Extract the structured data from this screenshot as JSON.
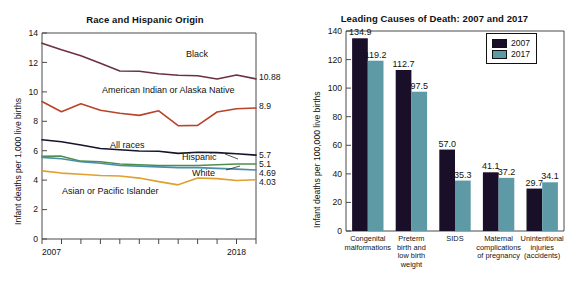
{
  "figure": {
    "width": 579,
    "height": 288,
    "background": "#ffffff"
  },
  "chart_data": [
    {
      "type": "line",
      "panel": "left",
      "title": "Race and Hispanic Origin",
      "xlabel": "",
      "ylabel": "Infant deaths per 1,000 live births",
      "xlim": [
        2007,
        2018
      ],
      "ylim": [
        0,
        14
      ],
      "yticks": [
        "0",
        "2",
        "4",
        "6",
        "8",
        "10",
        "12",
        "14"
      ],
      "xticks": [
        "2007",
        "2018"
      ],
      "x": [
        2007,
        2008,
        2009,
        2010,
        2011,
        2012,
        2013,
        2014,
        2015,
        2016,
        2017,
        2018
      ],
      "grid": false,
      "legend": "inline-labels",
      "series": [
        {
          "name": "Black",
          "color": "#6b3140",
          "label": "Black",
          "end_value": "10.88",
          "values": [
            13.31,
            12.86,
            12.45,
            11.95,
            11.42,
            11.4,
            11.23,
            11.13,
            11.09,
            10.87,
            11.15,
            10.88
          ]
        },
        {
          "name": "American Indian or Alaska Native",
          "color": "#b8432a",
          "label": "American Indian or Alaska Native",
          "end_value": "8.9",
          "values": [
            9.34,
            8.65,
            9.19,
            8.75,
            8.55,
            8.4,
            8.71,
            7.7,
            7.72,
            8.63,
            8.85,
            8.9
          ]
        },
        {
          "name": "All races",
          "color": "#14142c",
          "label": "All races",
          "end_value": "5.7",
          "values": [
            6.75,
            6.61,
            6.39,
            6.15,
            6.07,
            5.98,
            5.96,
            5.82,
            5.9,
            5.87,
            5.79,
            5.7
          ]
        },
        {
          "name": "Hispanic",
          "color": "#4f8f4b",
          "label": "Hispanic",
          "end_value": "5.1",
          "values": [
            5.62,
            5.63,
            5.29,
            5.25,
            5.1,
            5.05,
            5.0,
            5.0,
            5.0,
            5.05,
            5.1,
            5.1
          ]
        },
        {
          "name": "White",
          "color": "#4a8ea8",
          "label": "White",
          "end_value": "4.69",
          "values": [
            5.55,
            5.45,
            5.25,
            5.15,
            5.0,
            4.95,
            4.9,
            4.85,
            4.85,
            4.8,
            4.75,
            4.69
          ]
        },
        {
          "name": "Asian or Pacific Islander",
          "color": "#e0a030",
          "label": "Asian or Pacific Islander",
          "end_value": "4.03",
          "values": [
            4.63,
            4.48,
            4.4,
            4.32,
            4.28,
            4.14,
            3.9,
            3.68,
            4.15,
            4.1,
            3.98,
            4.03
          ]
        }
      ]
    },
    {
      "type": "bar",
      "panel": "right",
      "title": "Leading Causes of Death: 2007 and 2017",
      "xlabel": "",
      "ylabel": "Infant deaths per 100,000 live births",
      "ylim": [
        0,
        140
      ],
      "yticks": [
        "0",
        "20",
        "40",
        "60",
        "80",
        "100",
        "120",
        "140"
      ],
      "grid": false,
      "legend_position": "top-right",
      "categories": [
        "Congenital\nmalformations",
        "Preterm\nbirth and\nlow birth\nweight",
        "SIDS",
        "Maternal\ncomplications\nof pregnancy",
        "Unintentional\ninjuries\n(accidents)"
      ],
      "series": [
        {
          "name": "2007",
          "color": "#1a0f28",
          "values": [
            134.9,
            112.7,
            57.0,
            41.1,
            29.7
          ]
        },
        {
          "name": "2017",
          "color": "#5e9aa5",
          "values": [
            119.2,
            97.5,
            35.3,
            37.2,
            34.1
          ]
        }
      ],
      "value_labels": [
        [
          "134.9",
          "119.2"
        ],
        [
          "112.7",
          "97.5"
        ],
        [
          "57.0",
          "35.3"
        ],
        [
          "41.1",
          "37.2"
        ],
        [
          "29.7",
          "34.1"
        ]
      ]
    }
  ]
}
